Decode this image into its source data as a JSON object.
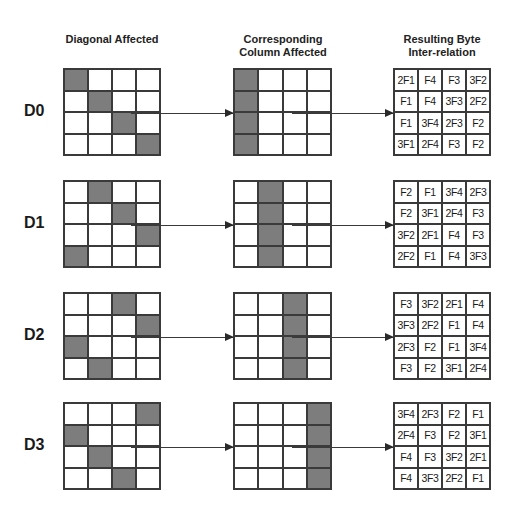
{
  "headers": {
    "diagonal": "Diagonal Affected",
    "column_line1": "Corresponding",
    "column_line2": "Column Affected",
    "result_line1": "Resulting Byte",
    "result_line2": "Inter-relation"
  },
  "colors": {
    "shaded": "#7d7d7d",
    "grid_line": "#3a3a3a",
    "background": "#ffffff"
  },
  "rows": [
    {
      "label": "D0",
      "diagonal_shaded": [
        [
          0,
          0
        ],
        [
          1,
          1
        ],
        [
          2,
          2
        ],
        [
          3,
          3
        ]
      ],
      "column_shaded": 0,
      "result": [
        [
          "2F1",
          "F4",
          "F3",
          "3F2"
        ],
        [
          "F1",
          "F4",
          "3F3",
          "2F2"
        ],
        [
          "F1",
          "3F4",
          "2F3",
          "F2"
        ],
        [
          "3F1",
          "2F4",
          "F3",
          "F2"
        ]
      ]
    },
    {
      "label": "D1",
      "diagonal_shaded": [
        [
          0,
          1
        ],
        [
          1,
          2
        ],
        [
          2,
          3
        ],
        [
          3,
          0
        ]
      ],
      "column_shaded": 1,
      "result": [
        [
          "F2",
          "F1",
          "3F4",
          "2F3"
        ],
        [
          "F2",
          "3F1",
          "2F4",
          "F3"
        ],
        [
          "3F2",
          "2F1",
          "F4",
          "F3"
        ],
        [
          "2F2",
          "F1",
          "F4",
          "3F3"
        ]
      ]
    },
    {
      "label": "D2",
      "diagonal_shaded": [
        [
          0,
          2
        ],
        [
          1,
          3
        ],
        [
          2,
          0
        ],
        [
          3,
          1
        ]
      ],
      "column_shaded": 2,
      "result": [
        [
          "F3",
          "3F2",
          "2F1",
          "F4"
        ],
        [
          "3F3",
          "2F2",
          "F1",
          "F4"
        ],
        [
          "2F3",
          "F2",
          "F1",
          "3F4"
        ],
        [
          "F3",
          "F2",
          "3F1",
          "2F4"
        ]
      ]
    },
    {
      "label": "D3",
      "diagonal_shaded": [
        [
          0,
          3
        ],
        [
          1,
          0
        ],
        [
          2,
          1
        ],
        [
          3,
          2
        ]
      ],
      "column_shaded": 3,
      "result": [
        [
          "3F4",
          "2F3",
          "F2",
          "F1"
        ],
        [
          "2F4",
          "F3",
          "F2",
          "3F1"
        ],
        [
          "F4",
          "F3",
          "3F2",
          "2F1"
        ],
        [
          "F4",
          "3F3",
          "2F2",
          "F1"
        ]
      ]
    }
  ]
}
